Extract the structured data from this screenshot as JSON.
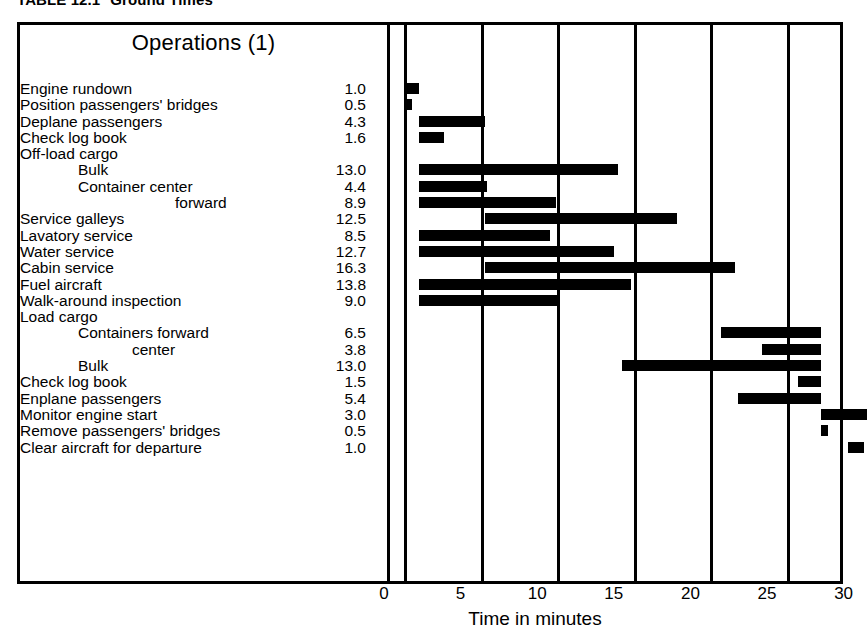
{
  "caption": {
    "number": "TABLE 12.1",
    "title": "Ground Times"
  },
  "header": {
    "operations_label": "Operations (1)"
  },
  "axis": {
    "title": "Time in minutes",
    "ticks": [
      "0",
      "5",
      "10",
      "15",
      "20",
      "25",
      "30"
    ]
  },
  "chart_data": {
    "type": "bar",
    "subtype": "gantt",
    "xlabel": "Time in minutes",
    "ylabel": "Operations (1)",
    "xlim": [
      0,
      30
    ],
    "xticks": [
      0,
      5,
      10,
      15,
      20,
      25,
      30
    ],
    "grid": true,
    "legend": "none",
    "duration_column_header": "",
    "tasks": [
      {
        "label": "Engine rundown",
        "indent": 0,
        "duration": "1.0",
        "start": 0.0,
        "end": 1.0,
        "has_bar": true
      },
      {
        "label": "Position passengers' bridges",
        "indent": 0,
        "duration": "0.5",
        "start": 0.0,
        "end": 0.5,
        "has_bar": true
      },
      {
        "label": "Deplane passengers",
        "indent": 0,
        "duration": "4.3",
        "start": 1.0,
        "end": 5.3,
        "has_bar": true
      },
      {
        "label": "Check log book",
        "indent": 0,
        "duration": "1.6",
        "start": 1.0,
        "end": 2.6,
        "has_bar": true
      },
      {
        "label": "Off-load cargo",
        "indent": 0,
        "duration": "",
        "start": null,
        "end": null,
        "has_bar": false
      },
      {
        "label": "Bulk",
        "indent": 1,
        "duration": "13.0",
        "start": 1.0,
        "end": 14.0,
        "has_bar": true
      },
      {
        "label": "Container center",
        "indent": 1,
        "duration": "4.4",
        "start": 1.0,
        "end": 5.4,
        "has_bar": true
      },
      {
        "label": "forward",
        "indent": 3,
        "duration": "8.9",
        "start": 1.0,
        "end": 9.9,
        "has_bar": true
      },
      {
        "label": "Service galleys",
        "indent": 0,
        "duration": "12.5",
        "start": 5.3,
        "end": 17.8,
        "has_bar": true
      },
      {
        "label": "Lavatory service",
        "indent": 0,
        "duration": "8.5",
        "start": 1.0,
        "end": 9.5,
        "has_bar": true
      },
      {
        "label": "Water service",
        "indent": 0,
        "duration": "12.7",
        "start": 1.0,
        "end": 13.7,
        "has_bar": true
      },
      {
        "label": "Cabin service",
        "indent": 0,
        "duration": "16.3",
        "start": 5.3,
        "end": 21.6,
        "has_bar": true
      },
      {
        "label": "Fuel aircraft",
        "indent": 0,
        "duration": "13.8",
        "start": 1.0,
        "end": 14.8,
        "has_bar": true
      },
      {
        "label": "Walk-around inspection",
        "indent": 0,
        "duration": "9.0",
        "start": 1.0,
        "end": 10.0,
        "has_bar": true
      },
      {
        "label": "Load cargo",
        "indent": 0,
        "duration": "",
        "start": null,
        "end": null,
        "has_bar": false
      },
      {
        "label": "Containers forward",
        "indent": 1,
        "duration": "6.5",
        "start": 20.7,
        "end": 27.2,
        "has_bar": true
      },
      {
        "label": "center",
        "indent": 2,
        "duration": "3.8",
        "start": 23.4,
        "end": 27.2,
        "has_bar": true
      },
      {
        "label": "Bulk",
        "indent": 1,
        "duration": "13.0",
        "start": 14.2,
        "end": 27.2,
        "has_bar": true
      },
      {
        "label": "Check log book",
        "indent": 0,
        "duration": "1.5",
        "start": 25.7,
        "end": 27.2,
        "has_bar": true
      },
      {
        "label": "Enplane passengers",
        "indent": 0,
        "duration": "5.4",
        "start": 21.8,
        "end": 27.2,
        "has_bar": true
      },
      {
        "label": "Monitor engine start",
        "indent": 0,
        "duration": "3.0",
        "start": 27.2,
        "end": 30.2,
        "has_bar": true
      },
      {
        "label": "Remove passengers' bridges",
        "indent": 0,
        "duration": "0.5",
        "start": 27.2,
        "end": 27.7,
        "has_bar": true
      },
      {
        "label": "Clear aircraft for departure",
        "indent": 0,
        "duration": "1.0",
        "start": 29.0,
        "end": 30.0,
        "has_bar": true
      }
    ]
  },
  "colors": {
    "bar": "#000000",
    "frame": "#000000",
    "background": "#ffffff"
  }
}
